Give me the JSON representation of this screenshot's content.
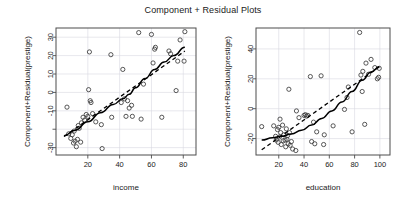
{
  "figure": {
    "title": "Component + Residual Plots",
    "background": "#ffffff",
    "point_color": "#3a3a3a",
    "line_color": "#000000",
    "grid_color": "#d9d9e0"
  },
  "chart_data": [
    {
      "type": "scatter",
      "panel": "left",
      "title": "Component + Residual Plots",
      "xlabel": "income",
      "ylabel": "Component+Residual(prestige)",
      "xlim": [
        0,
        88
      ],
      "ylim": [
        -34,
        35
      ],
      "xticks": [
        20,
        40,
        60,
        80
      ],
      "yticks": [
        -30,
        -20,
        -10,
        0,
        10,
        20,
        30
      ],
      "ytick_labels": [
        "-30",
        "",
        "-10",
        "0",
        "10",
        "20",
        "30"
      ],
      "grid": true,
      "legend": "none",
      "points": [
        [
          6.9,
          -8.0
        ],
        [
          8.0,
          -22.5
        ],
        [
          9.3,
          -25.0
        ],
        [
          10.2,
          -23.0
        ],
        [
          11.0,
          -27.5
        ],
        [
          11.4,
          -21.0
        ],
        [
          12.0,
          -26.5
        ],
        [
          12.8,
          -29.5
        ],
        [
          13.5,
          -25.5
        ],
        [
          14.0,
          -18.0
        ],
        [
          14.6,
          -19.5
        ],
        [
          15.5,
          -27.0
        ],
        [
          16.0,
          -16.5
        ],
        [
          17.0,
          -13.5
        ],
        [
          18.0,
          -15.0
        ],
        [
          19.0,
          -12.0
        ],
        [
          20.0,
          -13.0
        ],
        [
          20.5,
          1.5
        ],
        [
          21.0,
          22.0
        ],
        [
          21.5,
          -4.5
        ],
        [
          22.0,
          -5.5
        ],
        [
          23.0,
          -11.5
        ],
        [
          25.0,
          -16.0
        ],
        [
          28.5,
          -17.5
        ],
        [
          29.0,
          -30.5
        ],
        [
          34.5,
          20.5
        ],
        [
          35.0,
          -13.5
        ],
        [
          41.0,
          -5.5
        ],
        [
          42.0,
          12.5
        ],
        [
          43.0,
          -3.5
        ],
        [
          44.0,
          -13.0
        ],
        [
          45.0,
          -4.5
        ],
        [
          46.0,
          -8.5
        ],
        [
          47.5,
          -7.0
        ],
        [
          48.0,
          -13.0
        ],
        [
          52.0,
          32.5
        ],
        [
          53.5,
          -14.5
        ],
        [
          55.0,
          4.5
        ],
        [
          60.0,
          31.5
        ],
        [
          61.0,
          16.0
        ],
        [
          62.0,
          23.5
        ],
        [
          62.5,
          24.5
        ],
        [
          66.5,
          -13.5
        ],
        [
          71.0,
          22.5
        ],
        [
          72.0,
          21.0
        ],
        [
          75.5,
          1.0
        ],
        [
          76.5,
          17.0
        ],
        [
          78.0,
          28.5
        ],
        [
          80.5,
          17.0
        ],
        [
          81.0,
          33.0
        ]
      ],
      "smooth_line": {
        "style": "solid",
        "description": "loess smooth",
        "points": [
          [
            5.0,
            -23.5
          ],
          [
            12.0,
            -20.5
          ],
          [
            20.0,
            -16.0
          ],
          [
            28.0,
            -11.0
          ],
          [
            36.0,
            -6.5
          ],
          [
            42.0,
            -3.5
          ],
          [
            46.0,
            -1.0
          ],
          [
            50.0,
            2.5
          ],
          [
            56.0,
            7.5
          ],
          [
            62.0,
            12.5
          ],
          [
            68.0,
            16.5
          ],
          [
            74.0,
            20.0
          ],
          [
            81.0,
            24.5
          ]
        ]
      },
      "linear_line": {
        "style": "dashed",
        "description": "partial-residual linear fit",
        "points": [
          [
            5.0,
            -24.0
          ],
          [
            81.0,
            22.5
          ]
        ]
      }
    },
    {
      "type": "scatter",
      "panel": "right",
      "title": "Component + Residual Plots",
      "xlabel": "education",
      "ylabel": "Component+Residual(prestige)",
      "xlim": [
        2,
        108
      ],
      "ylim": [
        -31,
        54
      ],
      "xticks": [
        20,
        40,
        60,
        80,
        100
      ],
      "yticks": [
        -20,
        0,
        20,
        40
      ],
      "ytick_labels": [
        "-20",
        "0",
        "20",
        "40"
      ],
      "grid": true,
      "legend": "none",
      "points": [
        [
          6.5,
          -12.0
        ],
        [
          16.0,
          -11.5
        ],
        [
          17.5,
          -18.5
        ],
        [
          18.0,
          -21.0
        ],
        [
          19.0,
          -14.0
        ],
        [
          19.5,
          -22.5
        ],
        [
          20.0,
          -12.5
        ],
        [
          20.5,
          -19.0
        ],
        [
          21.0,
          -7.0
        ],
        [
          21.5,
          -16.0
        ],
        [
          22.0,
          -24.0
        ],
        [
          23.0,
          -11.0
        ],
        [
          23.5,
          -21.5
        ],
        [
          24.0,
          -17.5
        ],
        [
          25.0,
          -21.0
        ],
        [
          25.5,
          -25.5
        ],
        [
          26.0,
          -13.5
        ],
        [
          26.5,
          -20.5
        ],
        [
          27.0,
          -18.0
        ],
        [
          27.5,
          -23.5
        ],
        [
          28.0,
          13.0
        ],
        [
          28.5,
          -16.0
        ],
        [
          29.0,
          -24.5
        ],
        [
          30.0,
          -22.0
        ],
        [
          31.0,
          -27.0
        ],
        [
          33.5,
          -28.0
        ],
        [
          34.0,
          -1.5
        ],
        [
          36.0,
          -6.0
        ],
        [
          40.0,
          -4.5
        ],
        [
          41.0,
          -4.0
        ],
        [
          42.0,
          -5.0
        ],
        [
          43.0,
          -4.5
        ],
        [
          45.0,
          21.5
        ],
        [
          46.0,
          -22.0
        ],
        [
          47.5,
          -9.0
        ],
        [
          48.5,
          -23.5
        ],
        [
          50.0,
          -15.5
        ],
        [
          53.5,
          22.0
        ],
        [
          55.5,
          -24.0
        ],
        [
          56.0,
          -17.5
        ],
        [
          63.0,
          -11.5
        ],
        [
          72.0,
          -0.5
        ],
        [
          74.0,
          7.5
        ],
        [
          75.0,
          14.5
        ],
        [
          78.0,
          -15.5
        ],
        [
          84.0,
          51.0
        ],
        [
          85.0,
          22.5
        ],
        [
          86.0,
          11.5
        ],
        [
          86.5,
          25.0
        ],
        [
          88.0,
          -10.5
        ],
        [
          89.0,
          30.5
        ],
        [
          91.0,
          23.0
        ],
        [
          93.0,
          33.0
        ],
        [
          96.0,
          27.5
        ],
        [
          98.0,
          20.0
        ],
        [
          99.0,
          21.0
        ],
        [
          99.5,
          27.0
        ]
      ],
      "smooth_line": {
        "style": "solid",
        "description": "loess smooth",
        "points": [
          [
            6.5,
            -21.0
          ],
          [
            15.0,
            -19.5
          ],
          [
            22.0,
            -18.5
          ],
          [
            30.0,
            -17.0
          ],
          [
            38.0,
            -14.5
          ],
          [
            46.0,
            -11.0
          ],
          [
            54.0,
            -6.5
          ],
          [
            62.0,
            -1.5
          ],
          [
            70.0,
            4.5
          ],
          [
            78.0,
            11.5
          ],
          [
            86.0,
            19.0
          ],
          [
            93.0,
            24.5
          ],
          [
            99.5,
            28.0
          ]
        ]
      },
      "linear_line": {
        "style": "dashed",
        "description": "partial-residual linear fit",
        "points": [
          [
            6.5,
            -27.5
          ],
          [
            99.5,
            28.0
          ]
        ]
      }
    }
  ]
}
